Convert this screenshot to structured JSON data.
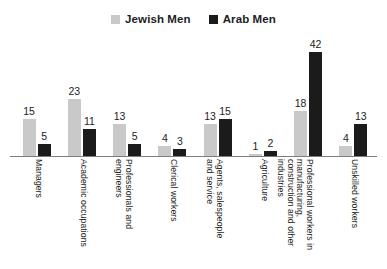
{
  "chart_data": {
    "type": "bar",
    "title": "",
    "xlabel": "",
    "ylabel": "",
    "ylim": [
      0,
      42
    ],
    "grid": false,
    "legend_position": "top-center",
    "categories": [
      "Managers",
      "Academic occupations",
      "Professionals and engineers",
      "Clerical workers",
      "Agents, salespeople and service",
      "Agriculture",
      "Professional workers in manufacturing, construction and other industries",
      "Unskilled workers"
    ],
    "series": [
      {
        "name": "Jewish Men",
        "color": "#c9c9c9",
        "values": [
          15,
          23,
          13,
          4,
          13,
          1,
          18,
          4
        ]
      },
      {
        "name": "Arab Men",
        "color": "#1b1b1b",
        "values": [
          5,
          11,
          5,
          3,
          15,
          2,
          42,
          13
        ]
      }
    ]
  },
  "legend": {
    "items": [
      {
        "label": "Jewish Men",
        "color": "#c9c9c9",
        "swatch_name": "legend-swatch-jewish-men"
      },
      {
        "label": "Arab Men",
        "color": "#1b1b1b",
        "swatch_name": "legend-swatch-arab-men"
      }
    ]
  },
  "caption": {
    "text": ""
  }
}
